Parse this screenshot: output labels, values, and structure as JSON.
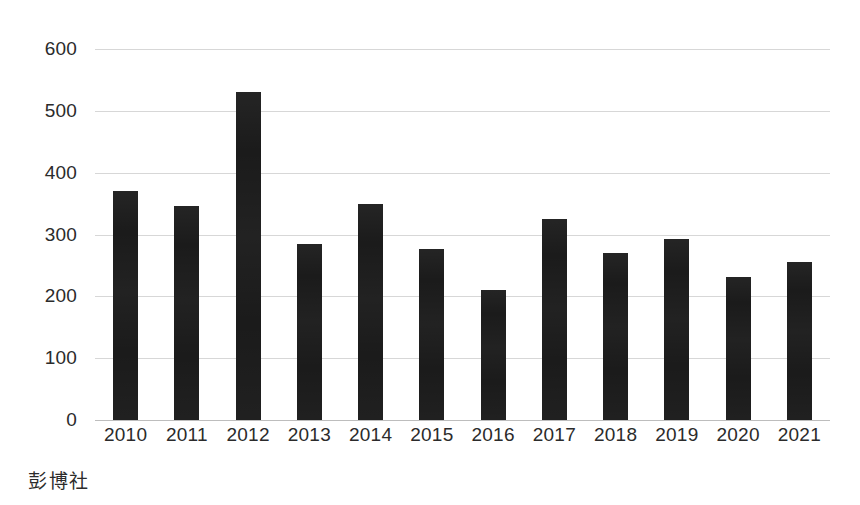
{
  "chart_data": {
    "type": "bar",
    "title": "",
    "subtitle": "",
    "xlabel": "",
    "ylabel": "",
    "categories": [
      "2010",
      "2011",
      "2012",
      "2013",
      "2014",
      "2015",
      "2016",
      "2017",
      "2018",
      "2019",
      "2020",
      "2021"
    ],
    "values": [
      370,
      346,
      530,
      285,
      350,
      277,
      210,
      325,
      270,
      292,
      232,
      255
    ],
    "ylim": [
      0,
      600
    ],
    "yticks": [
      0,
      100,
      200,
      300,
      400,
      500,
      600
    ],
    "ytick_labels": [
      "0",
      "100",
      "200",
      "300",
      "400",
      "500",
      "600"
    ],
    "grid": true,
    "legend": false,
    "legend_position": "none",
    "bar_color": "#1b1b1b",
    "gridline_color": "#c9c9c9",
    "annotations": []
  },
  "footer": {
    "source": "彭博社"
  }
}
